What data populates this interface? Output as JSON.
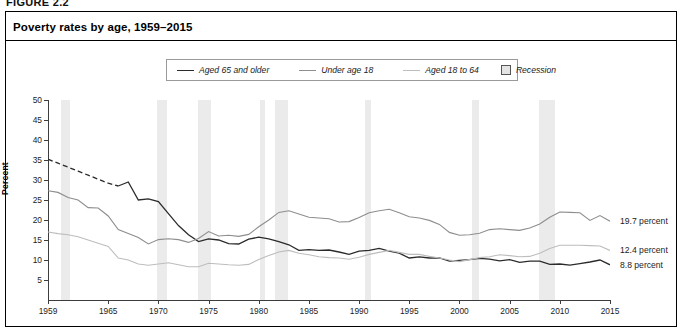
{
  "figure": {
    "tag": "FIGURE 2.2",
    "title": "Poverty rates by age, 1959–2015"
  },
  "legend": {
    "items": [
      {
        "label": "Aged 65 and older",
        "marker": "line",
        "color": "#2b2b2b"
      },
      {
        "label": "Under age 18",
        "marker": "line",
        "color": "#8e8e8e"
      },
      {
        "label": "Aged 18 to 64",
        "marker": "line",
        "color": "#bdbdbd"
      },
      {
        "label": "Recession",
        "marker": "box",
        "color": "#e4e4e4"
      }
    ]
  },
  "annotations": [
    {
      "text": "19.7 percent",
      "series": "Under age 18",
      "value": 19.7,
      "year": 2015
    },
    {
      "text": "12.4 percent",
      "series": "Aged 18 to 64",
      "value": 12.4,
      "year": 2015
    },
    {
      "text": "8.8 percent",
      "series": "Aged 65 and older",
      "value": 8.8,
      "year": 2015
    }
  ],
  "chart_data": {
    "type": "line",
    "title": "Poverty rates by age, 1959–2015",
    "xlabel": "",
    "ylabel": "Percent",
    "xlim": [
      1959,
      2015
    ],
    "ylim": [
      0,
      50
    ],
    "ytick_labels": [
      "5",
      "10",
      "15",
      "20",
      "25",
      "30",
      "35",
      "40",
      "45",
      "50"
    ],
    "ytick_values": [
      5,
      10,
      15,
      20,
      25,
      30,
      35,
      40,
      45,
      50
    ],
    "xtick_labels": [
      "1959",
      "1965",
      "1970",
      "1975",
      "1980",
      "1985",
      "1990",
      "1995",
      "2000",
      "2005",
      "2010",
      "2015"
    ],
    "xtick_values": [
      1959,
      1965,
      1970,
      1975,
      1980,
      1985,
      1990,
      1995,
      2000,
      2005,
      2010,
      2015
    ],
    "grid": false,
    "legend_position": "top-center",
    "series": [
      {
        "name": "Aged 65 and older",
        "color": "#2b2b2b",
        "width": 1.3,
        "dashed_until": 1966,
        "x": [
          1959,
          1960,
          1961,
          1962,
          1963,
          1964,
          1965,
          1966,
          1967,
          1968,
          1969,
          1970,
          1971,
          1972,
          1973,
          1974,
          1975,
          1976,
          1977,
          1978,
          1979,
          1980,
          1981,
          1982,
          1983,
          1984,
          1985,
          1986,
          1987,
          1988,
          1989,
          1990,
          1991,
          1992,
          1993,
          1994,
          1995,
          1996,
          1997,
          1998,
          1999,
          2000,
          2001,
          2002,
          2003,
          2004,
          2005,
          2006,
          2007,
          2008,
          2009,
          2010,
          2011,
          2012,
          2013,
          2014,
          2015
        ],
        "values": [
          35.2,
          34.2,
          33.2,
          32.2,
          31.2,
          30.2,
          29.2,
          28.5,
          29.5,
          25.0,
          25.3,
          24.6,
          21.6,
          18.6,
          16.3,
          14.6,
          15.3,
          15.0,
          14.1,
          14.0,
          15.2,
          15.7,
          15.3,
          14.6,
          13.8,
          12.4,
          12.6,
          12.4,
          12.5,
          12.0,
          11.4,
          12.2,
          12.4,
          12.9,
          12.2,
          11.7,
          10.5,
          10.8,
          10.5,
          10.5,
          9.7,
          9.9,
          10.1,
          10.4,
          10.2,
          9.8,
          10.1,
          9.4,
          9.7,
          9.7,
          8.9,
          9.0,
          8.7,
          9.1,
          9.5,
          10.0,
          8.8
        ]
      },
      {
        "name": "Under age 18",
        "color": "#8e8e8e",
        "width": 1.1,
        "x": [
          1959,
          1960,
          1961,
          1962,
          1963,
          1964,
          1965,
          1966,
          1967,
          1968,
          1969,
          1970,
          1971,
          1972,
          1973,
          1974,
          1975,
          1976,
          1977,
          1978,
          1979,
          1980,
          1981,
          1982,
          1983,
          1984,
          1985,
          1986,
          1987,
          1988,
          1989,
          1990,
          1991,
          1992,
          1993,
          1994,
          1995,
          1996,
          1997,
          1998,
          1999,
          2000,
          2001,
          2002,
          2003,
          2004,
          2005,
          2006,
          2007,
          2008,
          2009,
          2010,
          2011,
          2012,
          2013,
          2014,
          2015
        ],
        "values": [
          27.3,
          26.9,
          25.6,
          25.0,
          23.1,
          23.0,
          21.0,
          17.6,
          16.6,
          15.6,
          14.0,
          15.1,
          15.3,
          15.1,
          14.4,
          15.4,
          17.1,
          16.0,
          16.2,
          15.9,
          16.4,
          18.3,
          20.0,
          21.9,
          22.3,
          21.5,
          20.7,
          20.5,
          20.3,
          19.5,
          19.6,
          20.6,
          21.8,
          22.3,
          22.7,
          21.8,
          20.8,
          20.5,
          19.9,
          18.9,
          16.9,
          16.2,
          16.3,
          16.7,
          17.6,
          17.8,
          17.6,
          17.4,
          18.0,
          19.0,
          20.7,
          22.0,
          21.9,
          21.8,
          19.9,
          21.1,
          19.7
        ]
      },
      {
        "name": "Aged 18 to 64",
        "color": "#bdbdbd",
        "width": 1.1,
        "x": [
          1959,
          1960,
          1961,
          1962,
          1963,
          1964,
          1965,
          1966,
          1967,
          1968,
          1969,
          1970,
          1971,
          1972,
          1973,
          1974,
          1975,
          1976,
          1977,
          1978,
          1979,
          1980,
          1981,
          1982,
          1983,
          1984,
          1985,
          1986,
          1987,
          1988,
          1989,
          1990,
          1991,
          1992,
          1993,
          1994,
          1995,
          1996,
          1997,
          1998,
          1999,
          2000,
          2001,
          2002,
          2003,
          2004,
          2005,
          2006,
          2007,
          2008,
          2009,
          2010,
          2011,
          2012,
          2013,
          2014,
          2015
        ],
        "values": [
          17.0,
          16.6,
          16.3,
          15.8,
          15.0,
          14.2,
          13.4,
          10.5,
          10.0,
          9.0,
          8.7,
          9.0,
          9.3,
          8.8,
          8.3,
          8.3,
          9.2,
          9.0,
          8.8,
          8.7,
          8.9,
          10.1,
          11.1,
          12.0,
          12.4,
          11.7,
          11.3,
          10.8,
          10.6,
          10.5,
          10.2,
          10.7,
          11.4,
          11.9,
          12.4,
          11.9,
          11.4,
          11.4,
          10.9,
          10.5,
          10.0,
          9.6,
          10.1,
          10.6,
          10.8,
          11.3,
          11.1,
          10.8,
          10.9,
          11.7,
          12.9,
          13.7,
          13.7,
          13.7,
          13.6,
          13.5,
          12.4
        ]
      }
    ],
    "recessions": [
      {
        "start": 1960.3,
        "end": 1961.2
      },
      {
        "start": 1969.9,
        "end": 1970.9
      },
      {
        "start": 1973.9,
        "end": 1975.2
      },
      {
        "start": 1980.1,
        "end": 1980.6
      },
      {
        "start": 1981.6,
        "end": 1982.9
      },
      {
        "start": 1990.6,
        "end": 1991.2
      },
      {
        "start": 2001.2,
        "end": 2001.9
      },
      {
        "start": 2007.9,
        "end": 2009.5
      }
    ]
  }
}
